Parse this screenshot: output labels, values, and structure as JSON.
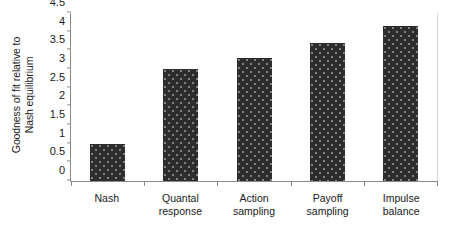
{
  "chart_data": {
    "type": "bar",
    "title": "",
    "xlabel": "",
    "ylabel": "Goodness of fit relative to Nash equilibrium",
    "ylabel_line1": "Goodness of fit relative to",
    "ylabel_line2": "Nash equilibrium",
    "categories": [
      "Nash",
      "Quantal response",
      "Action sampling",
      "Payoff sampling",
      "Impulse balance"
    ],
    "category_lines": [
      [
        "Nash"
      ],
      [
        "Quantal",
        "response"
      ],
      [
        "Action",
        "sampling"
      ],
      [
        "Payoff",
        "sampling"
      ],
      [
        "Impulse",
        "balance"
      ]
    ],
    "values": [
      1.0,
      3.0,
      3.3,
      3.7,
      4.15
    ],
    "ylim": [
      0,
      4.5
    ],
    "ytick_labels": [
      "0",
      "0.5",
      "1",
      "1.5",
      "2",
      "2.5",
      "3",
      "3.5",
      "4",
      "4.5"
    ],
    "ytick_values": [
      0,
      0.5,
      1,
      1.5,
      2,
      2.5,
      3,
      3.5,
      4,
      4.5
    ],
    "grid": false,
    "legend": "none",
    "bar_color": "#2d2d2d",
    "axis_color": "#8a8a8a",
    "background_color": "#ffffff"
  }
}
